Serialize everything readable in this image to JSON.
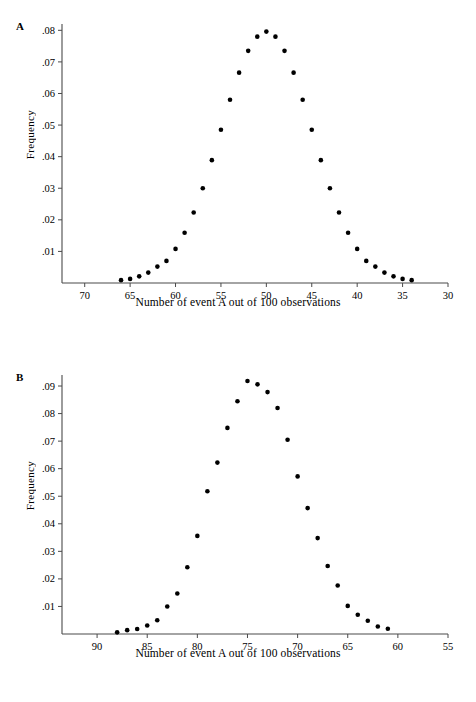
{
  "figure": {
    "panels": [
      {
        "id": "A",
        "label": "A",
        "ylabel": "Frequency",
        "xlabel": "Number of event A out of 100 observations",
        "yticks": [
          ".01",
          ".02",
          ".03",
          ".04",
          ".05",
          ".06",
          ".07",
          ".08"
        ],
        "xticks": [
          "70",
          "65",
          "60",
          "55",
          "50",
          "45",
          "40",
          "35",
          "30"
        ]
      },
      {
        "id": "B",
        "label": "B",
        "ylabel": "Frequency",
        "xlabel": "Number of event A out of 100 observations",
        "yticks": [
          ".01",
          ".02",
          ".03",
          ".04",
          ".05",
          ".06",
          ".07",
          ".08",
          ".09"
        ],
        "xticks": [
          "90",
          "85",
          "80",
          "75",
          "70",
          "65",
          "60",
          "55"
        ]
      }
    ]
  },
  "chart_data": [
    {
      "type": "scatter",
      "title": "A",
      "xlabel": "Number of event A out of 100 observations",
      "ylabel": "Frequency",
      "xlim": [
        72.5,
        30
      ],
      "ylim": [
        0,
        0.082
      ],
      "x_reversed": true,
      "grid": false,
      "legend": "none",
      "xtick_values": [
        70,
        65,
        60,
        55,
        50,
        45,
        40,
        35,
        30
      ],
      "xtick_labels": [
        "70",
        "65",
        "60",
        "55",
        "50",
        "45",
        "40",
        "35",
        "30"
      ],
      "ytick_values": [
        0.01,
        0.02,
        0.03,
        0.04,
        0.05,
        0.06,
        0.07,
        0.08
      ],
      "ytick_labels": [
        ".01",
        ".02",
        ".03",
        ".04",
        ".05",
        ".06",
        ".07",
        ".08"
      ],
      "x": [
        66,
        65,
        64,
        63,
        62,
        61,
        60,
        59,
        58,
        57,
        56,
        55,
        54,
        53,
        52,
        51,
        50,
        49,
        48,
        47,
        46,
        45,
        44,
        43,
        42,
        41,
        40,
        39,
        38,
        37,
        36,
        35,
        34
      ],
      "values": [
        0.0009,
        0.0013,
        0.0021,
        0.0033,
        0.0052,
        0.007,
        0.0108,
        0.0159,
        0.0223,
        0.03,
        0.0389,
        0.0485,
        0.058,
        0.0666,
        0.0735,
        0.078,
        0.0796,
        0.078,
        0.0735,
        0.0666,
        0.058,
        0.0485,
        0.0389,
        0.03,
        0.0223,
        0.0159,
        0.0108,
        0.007,
        0.0052,
        0.0033,
        0.0021,
        0.0013,
        0.0009
      ]
    },
    {
      "type": "scatter",
      "title": "B",
      "xlabel": "Number of event A out of 100 observations",
      "ylabel": "Frequency",
      "xlim": [
        93.5,
        55
      ],
      "ylim": [
        0,
        0.094
      ],
      "x_reversed": true,
      "grid": false,
      "legend": "none",
      "xtick_values": [
        90,
        85,
        80,
        75,
        70,
        65,
        60,
        55
      ],
      "xtick_labels": [
        "90",
        "85",
        "80",
        "75",
        "70",
        "65",
        "60",
        "55"
      ],
      "ytick_values": [
        0.01,
        0.02,
        0.03,
        0.04,
        0.05,
        0.06,
        0.07,
        0.08,
        0.09
      ],
      "ytick_labels": [
        ".01",
        ".02",
        ".03",
        ".04",
        ".05",
        ".06",
        ".07",
        ".08",
        ".09"
      ],
      "x": [
        88,
        87,
        86,
        85,
        84,
        83,
        82,
        81,
        80,
        79,
        78,
        77,
        76,
        75,
        74,
        73,
        72,
        71,
        70,
        69,
        68,
        67,
        66,
        65,
        64,
        63,
        62,
        61
      ],
      "values": [
        0.0006,
        0.0014,
        0.0018,
        0.0031,
        0.005,
        0.01,
        0.0147,
        0.0242,
        0.0356,
        0.0518,
        0.0622,
        0.0748,
        0.0845,
        0.0918,
        0.0906,
        0.0878,
        0.082,
        0.0705,
        0.0572,
        0.0457,
        0.0348,
        0.0247,
        0.0176,
        0.0102,
        0.007,
        0.0048,
        0.0027,
        0.0019
      ]
    }
  ]
}
